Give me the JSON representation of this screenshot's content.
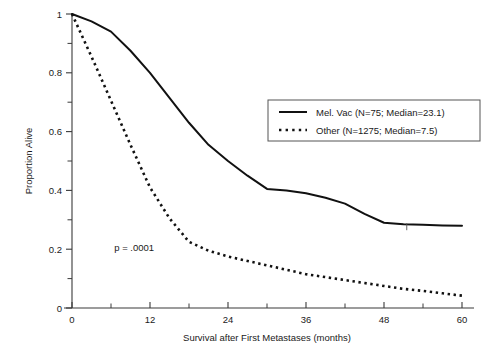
{
  "chart_data": {
    "type": "line",
    "title": "",
    "xlabel": "Survival after First Metastases (months)",
    "ylabel": "Proportion Alive",
    "xlim": [
      0,
      60
    ],
    "ylim": [
      0,
      1
    ],
    "grid": false,
    "legend_position": "upper-right-inside",
    "xticks": [
      0,
      12,
      24,
      36,
      48,
      60
    ],
    "xtick_labels": [
      "0",
      "12",
      "24",
      "36",
      "48",
      "60"
    ],
    "xticks_minor": [
      6,
      18,
      30,
      42,
      54
    ],
    "yticks": [
      0,
      0.2,
      0.4,
      0.6,
      0.8,
      1
    ],
    "ytick_labels": [
      "0",
      "0.2",
      "0.4",
      "0.6",
      "0.8",
      "1"
    ],
    "yticks_minor": [
      0.1,
      0.3,
      0.5,
      0.7,
      0.9
    ],
    "annotations": [
      {
        "text": "p = .0001",
        "x": 6.5,
        "y": 0.195
      }
    ],
    "series": [
      {
        "name": "Mel. Vac (N=75; Median=23.1)",
        "style": "solid",
        "n": 75,
        "median": 23.1,
        "x": [
          0,
          3,
          6,
          9,
          12,
          15,
          18,
          21,
          24,
          27,
          30,
          33,
          36,
          39,
          42,
          45,
          48,
          51,
          54,
          57,
          60
        ],
        "values": [
          1.0,
          0.975,
          0.94,
          0.875,
          0.8,
          0.715,
          0.63,
          0.555,
          0.5,
          0.45,
          0.405,
          0.4,
          0.39,
          0.375,
          0.355,
          0.32,
          0.29,
          0.285,
          0.283,
          0.281,
          0.28
        ]
      },
      {
        "name": "Other (N=1275; Median=7.5)",
        "style": "dotted",
        "n": 1275,
        "median": 7.5,
        "x": [
          0,
          3,
          6,
          9,
          12,
          15,
          18,
          21,
          24,
          27,
          30,
          33,
          36,
          39,
          42,
          45,
          48,
          51,
          54,
          57,
          60
        ],
        "values": [
          1.0,
          0.855,
          0.705,
          0.555,
          0.41,
          0.305,
          0.225,
          0.195,
          0.175,
          0.16,
          0.145,
          0.13,
          0.115,
          0.105,
          0.095,
          0.085,
          0.075,
          0.065,
          0.058,
          0.05,
          0.042
        ]
      }
    ],
    "censor_marks": [
      {
        "series": "Mel. Vac (N=75; Median=23.1)",
        "x": 51.5,
        "y": 0.285
      }
    ]
  },
  "legend": {
    "entries": [
      {
        "label": "Mel. Vac (N=75; Median=23.1)",
        "style": "solid"
      },
      {
        "label": "Other (N=1275; Median=7.5)",
        "style": "dotted"
      }
    ]
  },
  "colors": {
    "line": "#111111",
    "axis": "#3a3a3a",
    "text": "#1a1a1a",
    "background": "#ffffff",
    "legend_border": "#555555"
  }
}
